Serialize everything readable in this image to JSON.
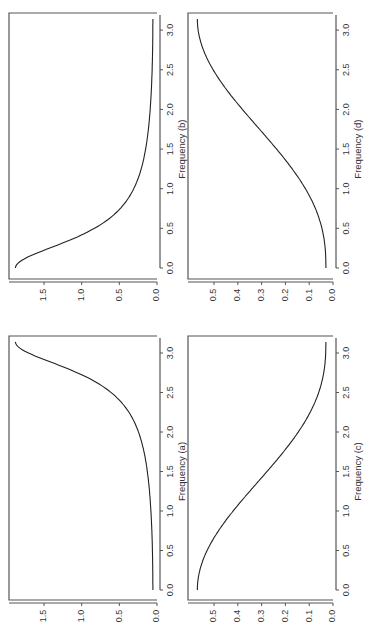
{
  "figure": {
    "rotation": "rotated 90 degrees counter-clockwise on page",
    "layout": "2x2 grid of spectral density panels"
  },
  "chart_data": [
    {
      "id": "a",
      "type": "line",
      "title": "",
      "xlabel": "Frequency (a)",
      "ylabel": "",
      "xlim": [
        0,
        3.14
      ],
      "ylim": [
        0,
        1.9
      ],
      "xticks": [
        "0.0",
        "0.5",
        "1.0",
        "1.5",
        "2.0",
        "2.5",
        "3.0"
      ],
      "yticks": [
        "0.0",
        "0.5",
        "1.0",
        "1.5"
      ],
      "x": [
        0.0,
        0.5,
        1.0,
        1.5,
        2.0,
        2.5,
        2.8,
        3.0,
        3.14
      ],
      "values": [
        0.06,
        0.06,
        0.08,
        0.12,
        0.22,
        0.55,
        1.1,
        1.6,
        1.88
      ]
    },
    {
      "id": "b",
      "type": "line",
      "title": "",
      "xlabel": "Frequency (b)",
      "ylabel": "",
      "xlim": [
        0,
        3.14
      ],
      "ylim": [
        0,
        1.9
      ],
      "xticks": [
        "0.0",
        "0.5",
        "1.0",
        "1.5",
        "2.0",
        "2.5",
        "3.0"
      ],
      "yticks": [
        "0.0",
        "0.5",
        "1.0",
        "1.5"
      ],
      "x": [
        0.0,
        0.14,
        0.34,
        0.64,
        1.14,
        1.64,
        2.14,
        2.64,
        3.14
      ],
      "values": [
        1.88,
        1.6,
        1.1,
        0.55,
        0.22,
        0.12,
        0.08,
        0.06,
        0.06
      ]
    },
    {
      "id": "c",
      "type": "line",
      "title": "",
      "xlabel": "Frequency (c)",
      "ylabel": "",
      "xlim": [
        0,
        3.14
      ],
      "ylim": [
        0,
        0.58
      ],
      "xticks": [
        "0.0",
        "0.5",
        "1.0",
        "1.5",
        "2.0",
        "2.5",
        "3.0"
      ],
      "yticks": [
        "0.0",
        "0.1",
        "0.2",
        "0.3",
        "0.4",
        "0.5"
      ],
      "x": [
        0.0,
        0.5,
        1.0,
        1.5,
        2.0,
        2.5,
        3.0,
        3.14
      ],
      "values": [
        0.57,
        0.52,
        0.43,
        0.31,
        0.19,
        0.08,
        0.035,
        0.03
      ]
    },
    {
      "id": "d",
      "type": "line",
      "title": "",
      "xlabel": "Frequency (d)",
      "ylabel": "",
      "xlim": [
        0,
        3.14
      ],
      "ylim": [
        0,
        0.58
      ],
      "xticks": [
        "0.0",
        "0.5",
        "1.0",
        "1.5",
        "2.0",
        "2.5",
        "3.0"
      ],
      "yticks": [
        "0.0",
        "0.1",
        "0.2",
        "0.3",
        "0.4",
        "0.5"
      ],
      "x": [
        0.0,
        0.14,
        0.64,
        1.14,
        1.64,
        2.14,
        2.64,
        3.14
      ],
      "values": [
        0.03,
        0.035,
        0.08,
        0.19,
        0.31,
        0.43,
        0.52,
        0.57
      ]
    }
  ],
  "panels": [
    {
      "id": "b",
      "xlabel": "Frequency (b)"
    },
    {
      "id": "d",
      "xlabel": "Frequency (d)"
    },
    {
      "id": "a",
      "xlabel": "Frequency (a)"
    },
    {
      "id": "c",
      "xlabel": "Frequency (c)"
    }
  ]
}
